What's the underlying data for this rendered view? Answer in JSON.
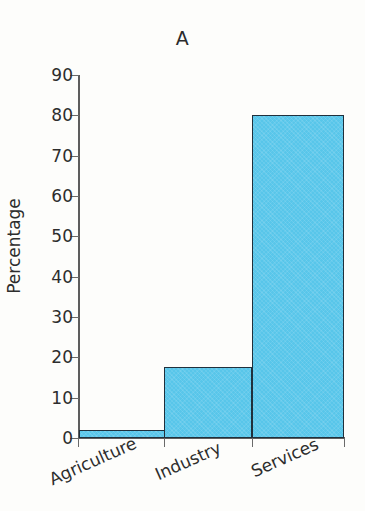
{
  "chart_data": {
    "type": "bar",
    "title": "A",
    "xlabel": "",
    "ylabel": "Percentage",
    "categories": [
      "Agriculture",
      "Industry",
      "Services"
    ],
    "values": [
      2,
      17.5,
      80
    ],
    "ylim": [
      0,
      90
    ],
    "ytick_labels": [
      "0",
      "10",
      "20",
      "30",
      "40",
      "50",
      "60",
      "70",
      "80",
      "90"
    ],
    "ytick_values": [
      0,
      10,
      20,
      30,
      40,
      50,
      60,
      70,
      80,
      90
    ],
    "grid": false,
    "legend": null,
    "series": [
      {
        "name": "Percentage",
        "values": [
          2,
          17.5,
          80
        ],
        "color": "#58c6ea",
        "edge_color": "#20303c"
      }
    ],
    "axis_color": "#5d5d5d",
    "background_color": "#fdfdfb",
    "xtick_label_rotation": -24
  }
}
